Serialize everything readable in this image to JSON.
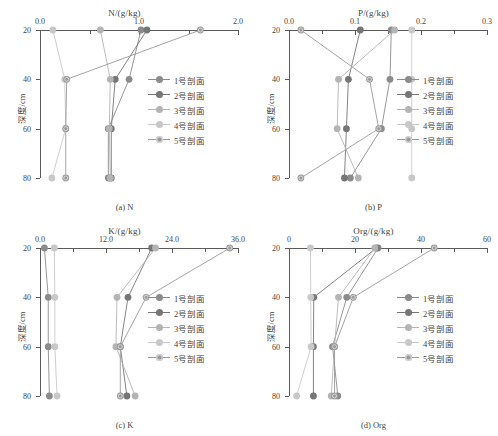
{
  "figure": {
    "y_axis_title": "深度/cm",
    "depths": [
      20,
      40,
      60,
      80
    ],
    "legend_labels": [
      "1号剖面",
      "2号剖面",
      "3号剖面",
      "4号剖面",
      "5号剖面"
    ],
    "series_colors": [
      "#8b8b8b",
      "#767676",
      "#b4b4b4",
      "#c8c8c8",
      "#9a9a9a"
    ]
  },
  "chart_data": [
    {
      "type": "line",
      "panel": "a",
      "title": "N/(g/kg)",
      "caption": "(a) N",
      "xlabel": "N/(g/kg)",
      "ylabel": "深度/cm",
      "xlim": [
        0.0,
        2.0
      ],
      "xticks": [
        0.0,
        1.0,
        2.0
      ],
      "xticklabels": [
        "0.0",
        "1.0",
        "2.0"
      ],
      "xminorticks": [
        0.5,
        1.5
      ],
      "ylim": [
        20,
        80
      ],
      "yticks": [
        20,
        40,
        60,
        80
      ],
      "yticklabels": [
        "20",
        "40",
        "60",
        "80"
      ],
      "grid": false,
      "legend_position": "right-inside",
      "x": [
        20,
        40,
        60,
        80
      ],
      "series": [
        {
          "name": "1号剖面",
          "values": [
            1.02,
            0.9,
            0.69,
            0.69
          ]
        },
        {
          "name": "2号剖面",
          "values": [
            1.08,
            0.76,
            0.72,
            0.72
          ]
        },
        {
          "name": "3号剖面",
          "values": [
            0.61,
            0.71,
            0.7,
            0.71
          ]
        },
        {
          "name": "4号剖面",
          "values": [
            0.13,
            0.25,
            0.26,
            0.12
          ]
        },
        {
          "name": "5号剖面",
          "values": [
            1.62,
            0.27,
            0.26,
            0.26
          ]
        }
      ]
    },
    {
      "type": "line",
      "panel": "b",
      "title": "P/(g/kg)",
      "caption": "(b) P",
      "xlabel": "P/(g/kg)",
      "ylabel": "深度/cm",
      "xlim": [
        0.0,
        0.3
      ],
      "xticks": [
        0.0,
        0.1,
        0.2,
        0.3
      ],
      "xticklabels": [
        "0.0",
        "0.1",
        "0.2",
        "0.3"
      ],
      "xminorticks": [
        0.05,
        0.15,
        0.25
      ],
      "ylim": [
        20,
        80
      ],
      "yticks": [
        20,
        40,
        60,
        80
      ],
      "yticklabels": [
        "20",
        "40",
        "60",
        "80"
      ],
      "grid": false,
      "legend_position": "right-inside",
      "x": [
        20,
        40,
        60,
        80
      ],
      "series": [
        {
          "name": "1号剖面",
          "values": [
            0.155,
            0.153,
            0.14,
            0.093
          ]
        },
        {
          "name": "2号剖面",
          "values": [
            0.108,
            0.09,
            0.087,
            0.084
          ]
        },
        {
          "name": "3号剖面",
          "values": [
            0.16,
            0.075,
            0.073,
            0.105
          ]
        },
        {
          "name": "4号剖面",
          "values": [
            0.186,
            0.186,
            0.186,
            0.186
          ]
        },
        {
          "name": "5号剖面",
          "values": [
            0.018,
            0.122,
            0.136,
            0.018
          ]
        }
      ]
    },
    {
      "type": "line",
      "panel": "c",
      "title": "K/(g/kg)",
      "caption": "(c) K",
      "xlabel": "K/(g/kg)",
      "ylabel": "深度/cm",
      "xlim": [
        0.0,
        36.0
      ],
      "xticks": [
        0.0,
        12.0,
        24.0,
        36.0
      ],
      "xticklabels": [
        "0.0",
        "12.0",
        "24.0",
        "36.0"
      ],
      "xminorticks": [
        6.0,
        18.0,
        30.0
      ],
      "ylim": [
        20,
        80
      ],
      "yticks": [
        20,
        40,
        60,
        80
      ],
      "yticklabels": [
        "20",
        "40",
        "60",
        "80"
      ],
      "grid": false,
      "legend_position": "right-inside",
      "x": [
        20,
        40,
        60,
        80
      ],
      "series": [
        {
          "name": "1号剖面",
          "values": [
            0.8,
            1.5,
            1.5,
            1.7
          ]
        },
        {
          "name": "2号剖面",
          "values": [
            20.3,
            16.0,
            14.6,
            15.8
          ]
        },
        {
          "name": "3号剖面",
          "values": [
            21.0,
            14.0,
            13.8,
            17.3
          ]
        },
        {
          "name": "4号剖面",
          "values": [
            2.6,
            2.7,
            2.7,
            3.1
          ]
        },
        {
          "name": "5号剖面",
          "values": [
            34.5,
            19.3,
            14.6,
            14.6
          ]
        }
      ]
    },
    {
      "type": "line",
      "panel": "d",
      "title": "Org/(g/kg)",
      "caption": "(d) Org",
      "xlabel": "Org/(g/kg)",
      "ylabel": "深度/cm",
      "xlim": [
        0,
        60
      ],
      "xticks": [
        0,
        20,
        40,
        60
      ],
      "xticklabels": [
        "0",
        "20",
        "40",
        "60"
      ],
      "xminorticks": [
        10,
        30,
        50
      ],
      "ylim": [
        20,
        80
      ],
      "yticks": [
        20,
        40,
        60,
        80
      ],
      "yticklabels": [
        "20",
        "40",
        "60",
        "80"
      ],
      "grid": false,
      "legend_position": "right-inside",
      "x": [
        20,
        40,
        60,
        80
      ],
      "series": [
        {
          "name": "1号剖面",
          "values": [
            27.0,
            17.5,
            13.2,
            14.8
          ]
        },
        {
          "name": "2号剖面",
          "values": [
            26.5,
            7.5,
            7.4,
            7.4
          ]
        },
        {
          "name": "3号剖面",
          "values": [
            26.0,
            15.0,
            13.8,
            12.8
          ]
        },
        {
          "name": "4号剖面",
          "values": [
            6.5,
            6.6,
            6.7,
            2.3
          ]
        },
        {
          "name": "5号剖面",
          "values": [
            44.0,
            19.5,
            13.8,
            13.8
          ]
        }
      ]
    }
  ]
}
